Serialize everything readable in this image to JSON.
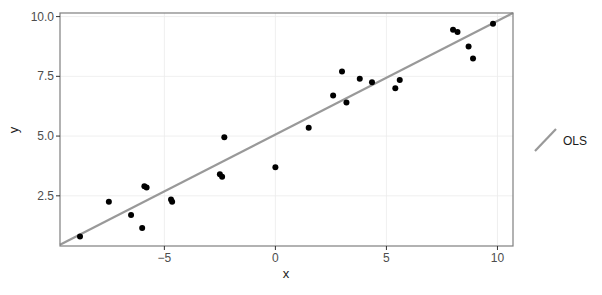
{
  "chart_data": {
    "type": "scatter",
    "title": "",
    "xlabel": "x",
    "ylabel": "y",
    "xlim": [
      -9.7,
      10.7
    ],
    "ylim": [
      0.4,
      10.15
    ],
    "x_ticks": [
      -5,
      0,
      5,
      10
    ],
    "x_tick_labels": [
      "−5",
      "0",
      "5",
      "10"
    ],
    "y_ticks": [
      2.5,
      5.0,
      7.5,
      10.0
    ],
    "y_tick_labels": [
      "2.5",
      "5.0",
      "7.5",
      "10.0"
    ],
    "grid": true,
    "legend_position": "right",
    "legend": [
      {
        "label": "OLS",
        "type": "line",
        "color": "#999999"
      }
    ],
    "points": {
      "color": "#000000",
      "x": [
        -8.8,
        -7.5,
        -6.5,
        -6.0,
        -5.9,
        -5.8,
        -4.7,
        -4.65,
        -2.5,
        -2.4,
        -2.3,
        0.0,
        1.5,
        2.6,
        3.0,
        3.2,
        3.8,
        4.35,
        5.4,
        5.6,
        8.0,
        8.2,
        8.7,
        8.9,
        9.8
      ],
      "y": [
        0.8,
        2.25,
        1.7,
        1.15,
        2.9,
        2.85,
        2.35,
        2.25,
        3.4,
        3.3,
        4.95,
        3.7,
        5.35,
        6.7,
        7.7,
        6.4,
        7.4,
        7.25,
        7.0,
        7.35,
        9.45,
        9.35,
        8.75,
        8.25,
        9.7
      ]
    },
    "lines": [
      {
        "name": "OLS",
        "color": "#999999",
        "x": [
          -9.7,
          10.7
        ],
        "y": [
          0.45,
          10.15
        ]
      }
    ]
  }
}
